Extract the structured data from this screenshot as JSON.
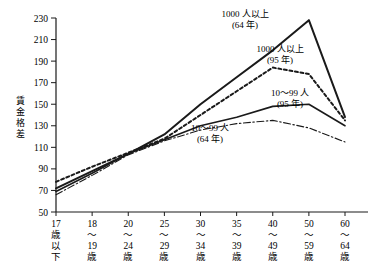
{
  "chart_data": {
    "type": "line",
    "title": "",
    "xlabel": "",
    "ylabel": "賃金格差",
    "ylim": [
      50,
      230
    ],
    "ytick_step": 20,
    "grid": false,
    "legend_position": "inline-annotations",
    "categories": [
      "17歳以下",
      "18〜19歳",
      "20〜24歳",
      "25〜29歳",
      "30〜34歳",
      "35〜39歳",
      "40〜49歳",
      "50〜59歳",
      "60〜64歳"
    ],
    "category_lines": [
      [
        "17",
        "歳",
        "以",
        "下"
      ],
      [
        "18",
        "〜",
        "19",
        "歳"
      ],
      [
        "20",
        "〜",
        "24",
        "歳"
      ],
      [
        "25",
        "〜",
        "29",
        "歳"
      ],
      [
        "30",
        "〜",
        "34",
        "歳"
      ],
      [
        "35",
        "〜",
        "39",
        "歳"
      ],
      [
        "40",
        "〜",
        "49",
        "歳"
      ],
      [
        "50",
        "〜",
        "59",
        "歳"
      ],
      [
        "60",
        "〜",
        "64",
        "歳"
      ]
    ],
    "yticks": [
      50,
      70,
      90,
      110,
      130,
      150,
      170,
      190,
      210,
      230
    ],
    "series": [
      {
        "name": "1000人以上（64年）",
        "style": "solid-thick",
        "values": [
          72,
          88,
          104,
          122,
          150,
          175,
          200,
          228,
          138
        ]
      },
      {
        "name": "1000人以上（95年）",
        "style": "dotted",
        "values": [
          78,
          92,
          105,
          118,
          140,
          162,
          184,
          178,
          135
        ]
      },
      {
        "name": "10〜99人（95年）",
        "style": "solid",
        "values": [
          69,
          86,
          104,
          117,
          130,
          138,
          148,
          150,
          130
        ]
      },
      {
        "name": "10〜99人（64年）",
        "style": "dash-dot",
        "values": [
          66,
          84,
          103,
          116,
          126,
          132,
          135,
          128,
          115
        ]
      }
    ],
    "annotations": [
      {
        "id": "ann-1000-64",
        "line1": "1000 人以上",
        "line2": "(64 年)"
      },
      {
        "id": "ann-1000-95",
        "line1": "1000 人以上",
        "line2": "(95 年)"
      },
      {
        "id": "ann-1099-95",
        "line1": "10〜99 人",
        "line2": "(95 年)"
      },
      {
        "id": "ann-1099-64",
        "line1": "10〜99 人",
        "line2": "(64 年)"
      }
    ],
    "colors": {
      "ink": "#1a1a1a",
      "axis": "#1a1a1a",
      "background": "#ffffff"
    }
  }
}
